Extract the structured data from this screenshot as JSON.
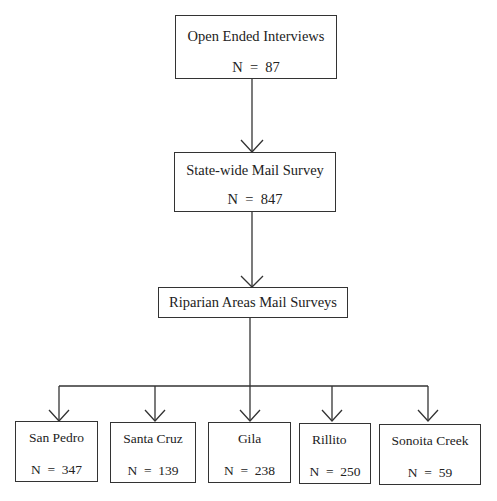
{
  "diagram": {
    "type": "flowchart",
    "nodes": [
      {
        "id": "interviews",
        "label": "Open Ended Interviews",
        "n": "N  =  87"
      },
      {
        "id": "statewide",
        "label": "State-wide Mail Survey",
        "n": "N  =  847"
      },
      {
        "id": "riparian",
        "label": "Riparian Areas Mail Surveys"
      },
      {
        "id": "san_pedro",
        "label": "San Pedro",
        "n": "N  =  347"
      },
      {
        "id": "santa_cruz",
        "label": "Santa Cruz",
        "n": "N  =  139"
      },
      {
        "id": "gila",
        "label": "Gila",
        "n": "N  =  238"
      },
      {
        "id": "rillito",
        "label": "Rillito",
        "n": "N  =  250"
      },
      {
        "id": "sonoita",
        "label": "Sonoita Creek",
        "n": "N  =  59"
      }
    ],
    "edges": [
      [
        "interviews",
        "statewide"
      ],
      [
        "statewide",
        "riparian"
      ],
      [
        "riparian",
        "san_pedro"
      ],
      [
        "riparian",
        "santa_cruz"
      ],
      [
        "riparian",
        "gila"
      ],
      [
        "riparian",
        "rillito"
      ],
      [
        "riparian",
        "sonoita"
      ]
    ],
    "line_color": "#333333"
  }
}
